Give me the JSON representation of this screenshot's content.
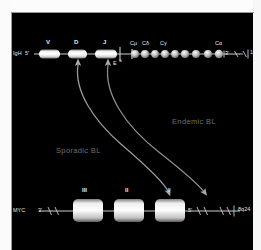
{
  "figure": {
    "background_color": "#000000",
    "text_color": "#e8e8e8",
    "dim_text_color": "#6f6f6f",
    "line_color": "#cfcfcf"
  },
  "igh_locus": {
    "name_label": "IgH",
    "five_prime_label": "5'",
    "three_prime_label": "3'",
    "cytoband": "14q32",
    "break_marks": "–/–",
    "segments": [
      {
        "label": "V",
        "x": 39,
        "w": 21
      },
      {
        "label": "D",
        "x": 68,
        "w": 19
      },
      {
        "label": "J",
        "x": 95,
        "w": 22
      }
    ],
    "constant_regions": [
      {
        "label": "Cμ",
        "x": 128
      },
      {
        "label": "Cδ",
        "x": 140
      },
      {
        "label": "Cγ",
        "x": 158
      },
      {
        "label": "Cα",
        "x": 215
      }
    ],
    "enhancer_label": "E",
    "switch_label": "S"
  },
  "myc_locus": {
    "name_label": "MYC",
    "five_prime_label": "5'",
    "three_prime_label": "3'",
    "cytoband": "8q24",
    "break_marks": "–/–",
    "exons": [
      {
        "label": "III",
        "x": 74,
        "w": 30
      },
      {
        "label": "II",
        "x": 115,
        "w": 30
      },
      {
        "label": "I",
        "x": 156,
        "w": 30
      }
    ]
  },
  "annotations": [
    {
      "name": "sporadic-bl",
      "label": "Sporadic BL",
      "color": "#9a9a9a"
    },
    {
      "name": "endemic-bl",
      "label": "Endemic BL",
      "color": "#7d7d7d"
    }
  ]
}
